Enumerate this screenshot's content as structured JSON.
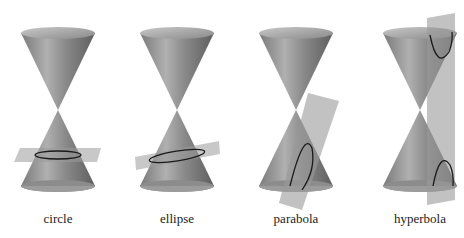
{
  "figure": {
    "panels": [
      {
        "id": "circle",
        "label": "circle",
        "cx": 58
      },
      {
        "id": "ellipse",
        "label": "ellipse",
        "cx": 177
      },
      {
        "id": "parabola",
        "label": "parabola",
        "cx": 296
      },
      {
        "id": "hyperbola",
        "label": "hyperbola",
        "cx": 420
      }
    ],
    "colors": {
      "cone_dark": "#6e6e6e",
      "cone_light": "#b4b4b4",
      "plane": "#9a9a9a",
      "curve": "#1a1a1a",
      "background": "#ffffff"
    }
  }
}
